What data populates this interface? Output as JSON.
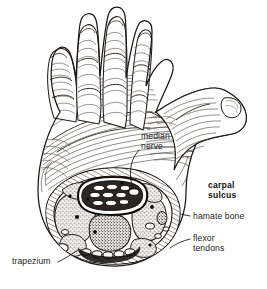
{
  "figure": {
    "view": "palmar view of right hand with transverse section through the wrist",
    "style": "pen-and-ink medical line engraving, black ink on white",
    "background_color": "#ffffff",
    "ink_color": "#1d1a18",
    "stipple_fill": "#8d8880"
  },
  "labels": [
    {
      "id": "median-nerve",
      "line1": "median",
      "line2": "nerve",
      "bold": false,
      "x": 141,
      "y": 136,
      "leader": "from label down-left into the carpal tunnel"
    },
    {
      "id": "carpal-sulcus",
      "line1": "carpal",
      "line2": "sulcus",
      "bold": true,
      "x": 208,
      "y": 184,
      "leader": "none"
    },
    {
      "id": "hamate-bone",
      "line1": "hamate bone",
      "line2": "",
      "bold": false,
      "x": 192,
      "y": 216,
      "leader": "short dash to right margin of section"
    },
    {
      "id": "flexor-tendons",
      "line1": "flexor",
      "line2": "tendons",
      "bold": false,
      "x": 192,
      "y": 236,
      "leader": "short dash to tendon ovals"
    },
    {
      "id": "trapezium",
      "line1": "trapezium",
      "line2": "",
      "bold": false,
      "x": 12,
      "y": 259,
      "leader": "diagonal line up-right to the section rim"
    }
  ],
  "anatomy": {
    "digits": [
      "index finger",
      "middle finger",
      "ring finger",
      "little finger",
      "thumb"
    ],
    "cross_section_contents": [
      "carpal sulcus",
      "median nerve",
      "flexor tendons",
      "hamate bone",
      "trapezium",
      "thenar muscles",
      "hypothenar muscles",
      "adductor pollicis",
      "interosseous muscles"
    ],
    "tendon_count_lower_row": 5,
    "tunnel_tendon_rows": 3
  }
}
